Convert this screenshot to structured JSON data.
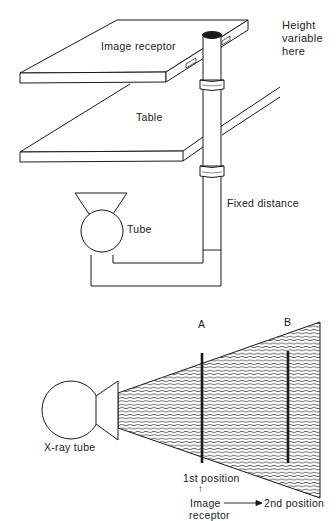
{
  "figure_top": {
    "labels": {
      "image_receptor": "Image receptor",
      "table": "Table",
      "tube": "Tube",
      "fixed_distance": "Fixed distance",
      "height_variable_line1": "Height",
      "height_variable_line2": "variable",
      "height_variable_line3": "here"
    }
  },
  "figure_bottom": {
    "labels": {
      "x_ray_tube": "X-ray tube",
      "position_a": "A",
      "position_b": "B",
      "first_position": "1st position",
      "arrow_up": "↑",
      "image": "Image",
      "receptor": "receptor",
      "second_position": "2nd position"
    }
  },
  "colors": {
    "ink": "#1a1a1a",
    "background": "#ffffff"
  }
}
